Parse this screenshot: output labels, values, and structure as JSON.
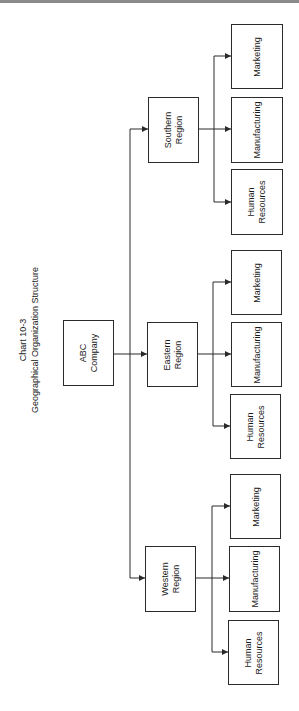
{
  "chart": {
    "number": "Chart 10-3",
    "title": "Geographical Organization Structure"
  },
  "root": {
    "label": "ABC\nCompany"
  },
  "regions": [
    {
      "label": "Southern\nRegion",
      "departments": [
        {
          "label": "Marketing"
        },
        {
          "label": "Manufacturing"
        },
        {
          "label": "Human\nResources"
        }
      ]
    },
    {
      "label": "Eastern\nRegion",
      "departments": [
        {
          "label": "Marketing"
        },
        {
          "label": "Manufacturing"
        },
        {
          "label": "Human\nResources"
        }
      ]
    },
    {
      "label": "Western\nRegion",
      "departments": [
        {
          "label": "Marketing"
        },
        {
          "label": "Manufacturing"
        },
        {
          "label": "Human\nResources"
        }
      ]
    }
  ],
  "colors": {
    "line": "#2a2a2a",
    "background": "#ffffff"
  }
}
